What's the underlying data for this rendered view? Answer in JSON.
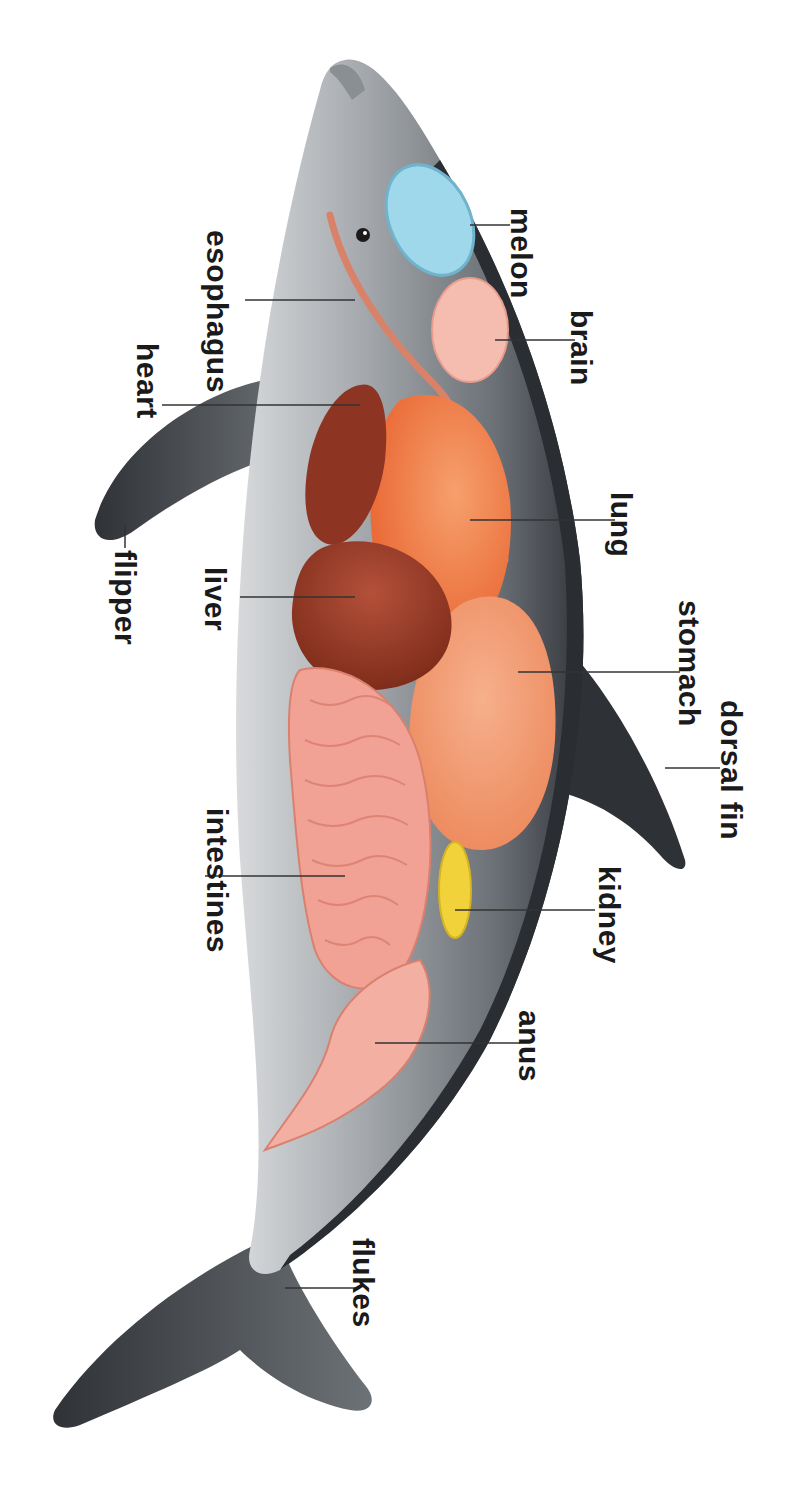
{
  "diagram": {
    "orientation": "rotated 90deg clockwise; head at top, flukes at bottom",
    "labels": [
      {
        "id": "melon",
        "text": "melon",
        "x": 538,
        "y": 208
      },
      {
        "id": "brain",
        "text": "brain",
        "x": 598,
        "y": 310
      },
      {
        "id": "esophagus",
        "text": "esophagus",
        "x": 234,
        "y": 230
      },
      {
        "id": "heart",
        "text": "heart",
        "x": 164,
        "y": 343
      },
      {
        "id": "lung",
        "text": "lung",
        "x": 638,
        "y": 492
      },
      {
        "id": "flipper",
        "text": "flipper",
        "x": 142,
        "y": 540
      },
      {
        "id": "liver",
        "text": "liver",
        "x": 232,
        "y": 567
      },
      {
        "id": "stomach",
        "text": "stomach",
        "x": 706,
        "y": 600
      },
      {
        "id": "dorsal_fin",
        "text": "dorsal fin",
        "x": 748,
        "y": 700
      },
      {
        "id": "intestines",
        "text": "intestines",
        "x": 234,
        "y": 808
      },
      {
        "id": "kidney",
        "text": "kidney",
        "x": 626,
        "y": 866
      },
      {
        "id": "anus",
        "text": "anus",
        "x": 546,
        "y": 1010
      },
      {
        "id": "flukes",
        "text": "flukes",
        "x": 380,
        "y": 1238
      }
    ],
    "colors": {
      "body_dark": "#3a3d42",
      "body_mid": "#7b8086",
      "body_light": "#c9ccce",
      "melon": "#8fd0e6",
      "brain": "#f3b7a8",
      "lung": "#ef7b48",
      "stomach": "#f29a72",
      "heart": "#8e3422",
      "liver": "#9a3a24",
      "intestines": "#f2a195",
      "kidney": "#f2d23a",
      "esophagus": "#e0896e",
      "label_text": "#1a1a1a"
    }
  }
}
